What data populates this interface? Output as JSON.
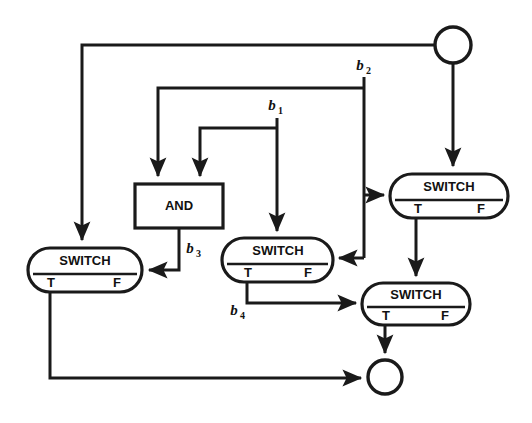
{
  "diagram": {
    "background_color": "#ffffff",
    "line_color": "#1a1a1a",
    "nodes": [
      {
        "id": "source-circle",
        "type": "circle",
        "label": "",
        "cx": 453,
        "cy": 45,
        "r": 18
      },
      {
        "id": "switch-top-right",
        "type": "switch",
        "label": "SWITCH",
        "true_port": "T",
        "false_port": "F",
        "x": 390,
        "y": 174,
        "width": 118,
        "height": 44
      },
      {
        "id": "and-gate",
        "type": "box",
        "label": "AND",
        "x": 135,
        "y": 184,
        "width": 88,
        "height": 44
      },
      {
        "id": "switch-middle",
        "type": "switch",
        "label": "SWITCH",
        "true_port": "T",
        "false_port": "F",
        "x": 222,
        "y": 238,
        "width": 111,
        "height": 44
      },
      {
        "id": "switch-left",
        "type": "switch",
        "label": "SWITCH",
        "true_port": "T",
        "false_port": "F",
        "x": 28,
        "y": 248,
        "width": 114,
        "height": 44
      },
      {
        "id": "switch-bottom-right",
        "type": "switch",
        "label": "SWITCH",
        "true_port": "T",
        "false_port": "F",
        "x": 362,
        "y": 283,
        "width": 108,
        "height": 42
      },
      {
        "id": "sink-circle",
        "type": "circle",
        "label": "",
        "cx": 385,
        "cy": 377,
        "r": 17
      }
    ],
    "variable_labels": [
      {
        "id": "b1",
        "base": "b",
        "subscript": "1",
        "x": 275,
        "y": 110
      },
      {
        "id": "b2",
        "base": "b",
        "subscript": "2",
        "x": 363,
        "y": 70
      },
      {
        "id": "b3",
        "base": "b",
        "subscript": "3",
        "x": 193,
        "y": 253
      },
      {
        "id": "b4",
        "base": "b",
        "subscript": "4",
        "x": 237,
        "y": 315
      }
    ],
    "edges": [
      {
        "id": "source-to-left-switch",
        "from": "source-circle",
        "to": "switch-left",
        "arrow": true
      },
      {
        "id": "source-to-top-right-switch",
        "from": "source-circle",
        "to": "switch-top-right",
        "arrow": true
      },
      {
        "id": "b2-to-and-left-input",
        "from": "b2",
        "to": "and-gate",
        "arrow": true
      },
      {
        "id": "b2-to-top-right-switch",
        "from": "b2",
        "to": "switch-top-right",
        "arrow": true
      },
      {
        "id": "b2-to-middle-switch",
        "from": "b2",
        "to": "switch-middle",
        "arrow": true
      },
      {
        "id": "b1-to-and-right-input",
        "from": "b1",
        "to": "and-gate",
        "arrow": true
      },
      {
        "id": "b1-to-middle-switch",
        "from": "b1",
        "to": "switch-middle",
        "arrow": true
      },
      {
        "id": "and-to-left-switch",
        "from": "and-gate",
        "to": "switch-left",
        "arrow": true,
        "label": "b3"
      },
      {
        "id": "middle-switch-t-to-bottom-right-switch",
        "from": "switch-middle",
        "to": "switch-bottom-right",
        "arrow": true,
        "label": "b4"
      },
      {
        "id": "top-right-switch-t-to-bottom-right-switch",
        "from": "switch-top-right",
        "to": "switch-bottom-right",
        "arrow": true
      },
      {
        "id": "bottom-right-switch-t-to-sink",
        "from": "switch-bottom-right",
        "to": "sink-circle",
        "arrow": true
      },
      {
        "id": "left-switch-t-to-sink",
        "from": "switch-left",
        "to": "sink-circle",
        "arrow": true
      }
    ]
  }
}
